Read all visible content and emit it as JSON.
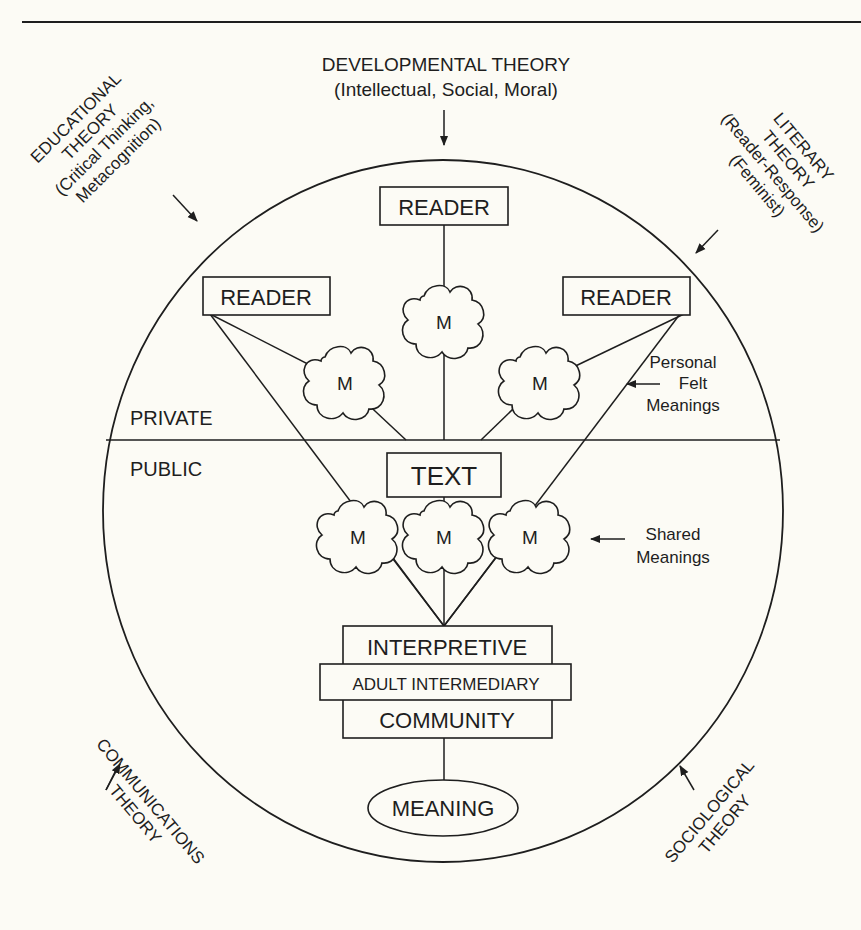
{
  "diagram": {
    "theories": {
      "developmental": {
        "title": "DEVELOPMENTAL THEORY",
        "subtitle": "(Intellectual, Social, Moral)"
      },
      "educational": {
        "line1": "EDUCATIONAL",
        "line2": "THEORY",
        "line3": "(Critical Thinking,",
        "line4": "Metacognition)"
      },
      "literary": {
        "line1": "LITERARY",
        "line2": "THEORY",
        "line3": "(Reader-Response)",
        "line4": "(Feminist)"
      },
      "communications": {
        "line1": "COMMUNICATIONS",
        "line2": "THEORY"
      },
      "sociological": {
        "line1": "SOCIOLOGICAL",
        "line2": "THEORY"
      }
    },
    "regions": {
      "private": "PRIVATE",
      "public": "PUBLIC"
    },
    "readers": [
      {
        "label": "READER",
        "position": "top"
      },
      {
        "label": "READER",
        "position": "left"
      },
      {
        "label": "READER",
        "position": "right"
      }
    ],
    "personal_meanings": {
      "cloud_label": "M",
      "annotation_line1": "Personal",
      "annotation_line2": "Felt",
      "annotation_line3": "Meanings"
    },
    "text_box": "TEXT",
    "shared_meanings": {
      "cloud_label": "M",
      "annotation_line1": "Shared",
      "annotation_line2": "Meanings"
    },
    "community_stack": {
      "top": "INTERPRETIVE",
      "middle": "ADULT INTERMEDIARY",
      "bottom": "COMMUNITY"
    },
    "meaning": "MEANING",
    "colors": {
      "ink": "#1e1e1e",
      "paper": "#fcfbf5"
    }
  }
}
